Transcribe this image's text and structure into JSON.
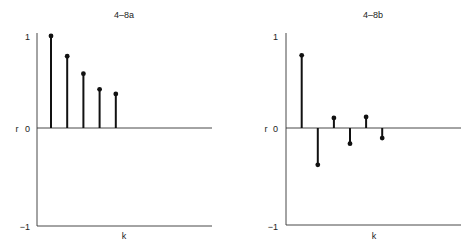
{
  "chart_data": [
    {
      "type": "stem",
      "title": "4–8a",
      "xlabel": "k",
      "ylabel": "r",
      "ylim": [
        -1,
        1
      ],
      "yticks": [
        "1",
        "0",
        "−1"
      ],
      "grid": false,
      "x": [
        1,
        2,
        3,
        4,
        5
      ],
      "values": [
        1.0,
        0.78,
        0.59,
        0.42,
        0.37
      ]
    },
    {
      "type": "stem",
      "title": "4–8b",
      "xlabel": "k",
      "ylabel": "r",
      "ylim": [
        -1,
        1
      ],
      "yticks": [
        "1",
        "0",
        "−1"
      ],
      "grid": false,
      "x": [
        1,
        2,
        3,
        4,
        5,
        6
      ],
      "values": [
        0.79,
        -0.4,
        0.11,
        -0.17,
        0.12,
        -0.11
      ]
    }
  ]
}
